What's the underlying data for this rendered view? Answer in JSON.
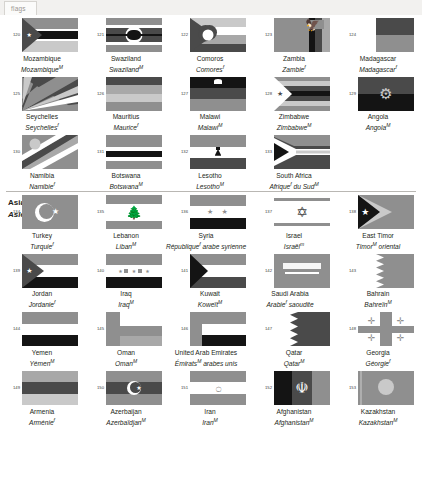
{
  "browser": {
    "tab_label": "flags"
  },
  "sections": [
    {
      "id": "africa-cont",
      "header_en": "",
      "header_fr": "",
      "rows": [
        {
          "cells": [
            {
              "num": "120",
              "en": "Mozambique",
              "fr": "Mozambique",
              "fr_sup": "M",
              "flag": "mozambique"
            },
            {
              "num": "121",
              "en": "Swaziland",
              "fr": "Swaziland",
              "fr_sup": "M",
              "flag": "swaziland"
            },
            {
              "num": "122",
              "en": "Comoros",
              "fr": "Comores",
              "fr_sup": "f",
              "flag": "comoros"
            },
            {
              "num": "123",
              "en": "Zambia",
              "fr": "Zambie",
              "fr_sup": "f",
              "flag": "zambia"
            },
            {
              "num": "124",
              "en": "Madagascar",
              "fr": "Madagascar",
              "fr_sup": "f",
              "flag": "madagascar"
            }
          ]
        },
        {
          "cells": [
            {
              "num": "125",
              "en": "Seychelles",
              "fr": "Seychelles",
              "fr_sup": "f",
              "flag": "seychelles"
            },
            {
              "num": "126",
              "en": "Mauritius",
              "fr": "Maurice",
              "fr_sup": "f",
              "flag": "mauritius"
            },
            {
              "num": "127",
              "en": "Malawi",
              "fr": "Malawi",
              "fr_sup": "M",
              "flag": "malawi"
            },
            {
              "num": "128",
              "en": "Zimbabwe",
              "fr": "Zimbabwe",
              "fr_sup": "M",
              "flag": "zimbabwe"
            },
            {
              "num": "129",
              "en": "Angola",
              "fr": "Angola",
              "fr_sup": "M",
              "flag": "angola"
            }
          ]
        },
        {
          "cells": [
            {
              "num": "130",
              "en": "Namibia",
              "fr": "Namibie",
              "fr_sup": "f",
              "flag": "namibia"
            },
            {
              "num": "131",
              "en": "Botswana",
              "fr": "Botswana",
              "fr_sup": "M",
              "flag": "botswana"
            },
            {
              "num": "132",
              "en": "Lesotho",
              "fr": "Lesotho",
              "fr_sup": "M",
              "flag": "lesotho"
            },
            {
              "num": "133",
              "en": "South Africa",
              "fr": "Afrique<sup>f</sup> du Sud",
              "fr_sup": "M",
              "flag": "southafrica"
            }
          ]
        }
      ]
    },
    {
      "id": "asia",
      "header_en": "Asia",
      "header_fr": "Asie",
      "header_fr_sup": "f",
      "rows": [
        {
          "cells": [
            {
              "num": "134",
              "en": "Turkey",
              "fr": "Turquie",
              "fr_sup": "f",
              "flag": "turkey"
            },
            {
              "num": "135",
              "en": "Lebanon",
              "fr": "Liban",
              "fr_sup": "M",
              "flag": "lebanon"
            },
            {
              "num": "136",
              "en": "Syria",
              "fr": "République<sup>f</sup> arabe syrienne",
              "fr_sup": "",
              "flag": "syria"
            },
            {
              "num": "137",
              "en": "Israel",
              "fr": "Israël",
              "fr_sup": "m",
              "flag": "israel"
            },
            {
              "num": "138",
              "en": "East Timor",
              "fr": "Timor<sup>M</sup> oriental",
              "fr_sup": "",
              "flag": "easttimor"
            }
          ]
        },
        {
          "cells": [
            {
              "num": "139",
              "en": "Jordan",
              "fr": "Jordanie",
              "fr_sup": "f",
              "flag": "jordan"
            },
            {
              "num": "140",
              "en": "Iraq",
              "fr": "Iraq",
              "fr_sup": "M",
              "flag": "iraq"
            },
            {
              "num": "141",
              "en": "Kuwait",
              "fr": "Koweït",
              "fr_sup": "M",
              "flag": "kuwait"
            },
            {
              "num": "142",
              "en": "Saudi Arabia",
              "fr": "Arabie<sup>f</sup> saoudite",
              "fr_sup": "",
              "flag": "saudi"
            },
            {
              "num": "143",
              "en": "Bahrain",
              "fr": "Bahreïn",
              "fr_sup": "M",
              "flag": "bahrain"
            }
          ]
        },
        {
          "cells": [
            {
              "num": "144",
              "en": "Yemen",
              "fr": "Yémen",
              "fr_sup": "M",
              "flag": "yemen"
            },
            {
              "num": "145",
              "en": "Oman",
              "fr": "Oman",
              "fr_sup": "M",
              "flag": "oman"
            },
            {
              "num": "146",
              "en": "United Arab Emirates",
              "fr": "Émirats<sup>M</sup> arabes unis",
              "fr_sup": "",
              "flag": "uae"
            },
            {
              "num": "147",
              "en": "Qatar",
              "fr": "Qatar",
              "fr_sup": "M",
              "flag": "qatar"
            },
            {
              "num": "148",
              "en": "Georgia",
              "fr": "Géorgie",
              "fr_sup": "f",
              "flag": "georgia"
            }
          ]
        },
        {
          "cells": [
            {
              "num": "149",
              "en": "Armenia",
              "fr": "Arménie",
              "fr_sup": "f",
              "flag": "armenia"
            },
            {
              "num": "150",
              "en": "Azerbaijan",
              "fr": "Azerbaïdjan",
              "fr_sup": "M",
              "flag": "azerbaijan"
            },
            {
              "num": "151",
              "en": "Iran",
              "fr": "Iran",
              "fr_sup": "M",
              "flag": "iran"
            },
            {
              "num": "152",
              "en": "Afghanistan",
              "fr": "Afghanistan",
              "fr_sup": "M",
              "flag": "afghanistan"
            },
            {
              "num": "153",
              "en": "Kazakhstan",
              "fr": "Kazakhstan",
              "fr_sup": "M",
              "flag": "kazakhstan"
            }
          ]
        }
      ]
    }
  ],
  "palette": {
    "page_bg": "#ffffff",
    "text": "#231f20",
    "rule": "#b9b7b3",
    "tab_bg": "#f2f1ef",
    "grey_light": "#c9c9c9",
    "grey_mid": "#8f8f8f",
    "grey_dark": "#4a4a4a",
    "black": "#111111",
    "white": "#ffffff"
  }
}
